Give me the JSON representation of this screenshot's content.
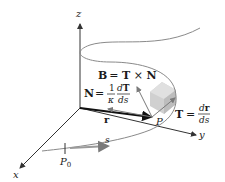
{
  "diagram": {
    "type": "frenet-frame",
    "axes": {
      "z_label": "z",
      "y_label": "y",
      "x_label": "x"
    },
    "labels": {
      "binormal": "B = T × N",
      "binormal_B": "B",
      "binormal_eq": "= T × N",
      "normal_N": "N",
      "normal_eq": "=",
      "normal_frac1_num": "1",
      "normal_frac1_den": "κ",
      "normal_frac2_num": "dT",
      "normal_frac2_den": "ds",
      "tangent_T": "T",
      "tangent_eq": "=",
      "tangent_frac_num": "dr",
      "tangent_frac_den": "ds",
      "position_vector": "r",
      "point": "P",
      "start_point": "P",
      "start_point_sub": "0",
      "arc_length": "s"
    },
    "colors": {
      "curve": "#8a8a8a",
      "axes": "#333333",
      "vector_arrows": "#7a7a7a",
      "osculating_plane": "#c8c8c8",
      "position_vector": "#111111"
    }
  }
}
